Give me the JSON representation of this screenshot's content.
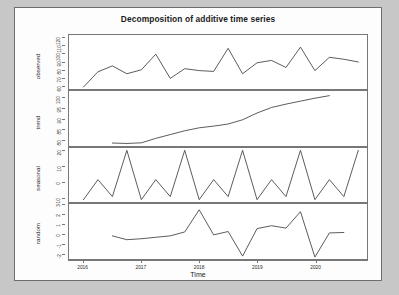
{
  "figure": {
    "title": "Decomposition of additive time series",
    "xlabel": "Time",
    "frame_color": "#6e6e6e",
    "line_color": "#4a4a4a",
    "axis_color": "#777777",
    "background": "#fdfdfd",
    "page_background": "#c7c7c7"
  },
  "xaxis": {
    "ticks": [
      "2016",
      "2017",
      "2018",
      "2019",
      "2020"
    ],
    "min": 2015.75,
    "max": 2020.9
  },
  "panels": [
    {
      "name": "observed",
      "label": "observed",
      "yticks": [
        "60",
        "70",
        "80",
        "90",
        "100",
        "110",
        "120"
      ],
      "ymin": 55,
      "ymax": 124
    },
    {
      "name": "trend",
      "label": "trend",
      "yticks": [
        "80",
        "85",
        "90",
        "95",
        "100"
      ],
      "ymin": 77,
      "ymax": 103
    },
    {
      "name": "seasonal",
      "label": "seasonal",
      "yticks": [
        "-10",
        "0",
        "10",
        "20"
      ],
      "ymin": -13,
      "ymax": 22
    },
    {
      "name": "random",
      "label": "random",
      "yticks": [
        "-2",
        "-1",
        "0",
        "1",
        "2",
        "3"
      ],
      "ymin": -2.6,
      "ymax": 3.1
    }
  ],
  "chart_data": {
    "type": "line",
    "title": "Decomposition of additive time series",
    "xlabel": "Time",
    "ylabel": "",
    "grid": false,
    "legend": "none",
    "frequency": 4,
    "period_label": "quarterly",
    "x": [
      2016.0,
      2016.25,
      2016.5,
      2016.75,
      2017.0,
      2017.25,
      2017.5,
      2017.75,
      2018.0,
      2018.25,
      2018.5,
      2018.75,
      2019.0,
      2019.25,
      2019.5,
      2019.75,
      2020.0,
      2020.25,
      2020.5,
      2020.75
    ],
    "series": [
      {
        "name": "observed",
        "panel": "observed",
        "ylim": [
          55,
          124
        ],
        "yticks": [
          60,
          70,
          80,
          90,
          100,
          110,
          120
        ],
        "values": [
          57.5,
          77.0,
          84.5,
          74.5,
          79.5,
          99.5,
          68.5,
          81.0,
          78.5,
          77.5,
          107.0,
          74.5,
          88.5,
          91.5,
          82.5,
          108.5,
          78.5,
          95.5,
          93.0,
          89.5
        ]
      },
      {
        "name": "trend",
        "panel": "trend",
        "ylim": [
          77,
          103
        ],
        "yticks": [
          80,
          85,
          90,
          95,
          100
        ],
        "values": [
          null,
          null,
          78.4,
          78.2,
          78.5,
          80.6,
          82.4,
          84.2,
          85.6,
          86.4,
          87.4,
          89.4,
          92.6,
          95.2,
          96.8,
          98.2,
          99.6,
          100.8,
          null,
          null
        ]
      },
      {
        "name": "seasonal",
        "panel": "seasonal",
        "ylim": [
          -13,
          22
        ],
        "yticks": [
          -10,
          0,
          10,
          20
        ],
        "values": [
          -11.5,
          1.5,
          -9.5,
          20.5,
          -11.5,
          1.5,
          -9.5,
          20.5,
          -11.5,
          1.5,
          -9.5,
          20.5,
          -11.5,
          1.5,
          -9.5,
          20.5,
          -11.5,
          1.5,
          -9.5,
          20.5
        ]
      },
      {
        "name": "random",
        "panel": "random",
        "ylim": [
          -2.6,
          3.1
        ],
        "yticks": [
          -2,
          -1,
          0,
          1,
          2,
          3
        ],
        "values": [
          null,
          null,
          -0.2,
          -0.6,
          -0.5,
          -0.35,
          -0.2,
          0.2,
          2.5,
          -0.1,
          0.25,
          -2.3,
          0.55,
          0.85,
          0.6,
          2.3,
          -2.4,
          0.1,
          0.15,
          null
        ]
      }
    ]
  }
}
